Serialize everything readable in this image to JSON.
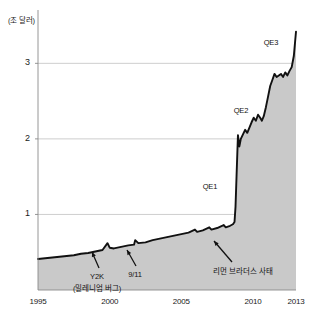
{
  "figure": {
    "background": "#ffffff",
    "width": 318,
    "height": 323
  },
  "chart_data": {
    "type": "area",
    "title": "",
    "subtitle": "",
    "xlabel": "",
    "ylabel": "(조 달러)",
    "ylabel_meaning": "trillion dollars",
    "xlim": [
      1995,
      2013
    ],
    "ylim": [
      0,
      3.6
    ],
    "yticks": [
      1,
      2,
      3
    ],
    "ytick_labels": [
      "1",
      "2",
      "3"
    ],
    "xticks": [
      1995,
      2000,
      2005,
      2010,
      2013
    ],
    "xtick_labels": [
      "1995",
      "2000",
      "2005",
      "2010",
      "2013"
    ],
    "grid": "horizontal",
    "legend": "none",
    "line_color": "#111111",
    "fill_color": "#c9c9c9",
    "grid_color": "#b9b9b9",
    "axis_color": "#8a8a8a",
    "series": [
      {
        "name": "Federal Reserve balance sheet",
        "x": [
          1995.0,
          1995.5,
          1996.0,
          1996.5,
          1997.0,
          1997.5,
          1998.0,
          1998.5,
          1999.0,
          1999.5,
          1999.85,
          2000.0,
          2000.3,
          2000.8,
          2001.3,
          2001.7,
          2001.78,
          2002.0,
          2002.5,
          2003.0,
          2003.5,
          2004.0,
          2004.5,
          2005.0,
          2005.5,
          2005.95,
          2006.1,
          2006.5,
          2006.95,
          2007.1,
          2007.5,
          2007.95,
          2008.1,
          2008.4,
          2008.6,
          2008.71,
          2008.78,
          2008.85,
          2008.95,
          2009.05,
          2009.15,
          2009.3,
          2009.45,
          2009.6,
          2009.75,
          2009.9,
          2010.05,
          2010.2,
          2010.35,
          2010.5,
          2010.62,
          2010.75,
          2010.9,
          2011.05,
          2011.2,
          2011.35,
          2011.5,
          2011.65,
          2011.8,
          2011.95,
          2012.1,
          2012.25,
          2012.4,
          2012.55,
          2012.7,
          2012.85,
          2013.0
        ],
        "values": [
          0.41,
          0.42,
          0.43,
          0.44,
          0.45,
          0.46,
          0.48,
          0.49,
          0.51,
          0.53,
          0.62,
          0.56,
          0.55,
          0.57,
          0.59,
          0.6,
          0.66,
          0.62,
          0.63,
          0.66,
          0.68,
          0.7,
          0.72,
          0.74,
          0.76,
          0.8,
          0.77,
          0.79,
          0.83,
          0.8,
          0.82,
          0.86,
          0.83,
          0.85,
          0.87,
          0.9,
          1.1,
          1.5,
          2.05,
          1.9,
          2.0,
          2.06,
          2.12,
          2.08,
          2.15,
          2.22,
          2.28,
          2.24,
          2.32,
          2.28,
          2.24,
          2.3,
          2.42,
          2.56,
          2.7,
          2.78,
          2.86,
          2.82,
          2.84,
          2.86,
          2.82,
          2.88,
          2.84,
          2.9,
          2.95,
          3.1,
          3.42
        ]
      }
    ],
    "annotations": [
      {
        "id": "qe1",
        "label": "QE1",
        "x_px": 210,
        "y_px": 182,
        "arrow": false
      },
      {
        "id": "qe2",
        "label": "QE2",
        "x_px": 241,
        "y_px": 106,
        "arrow": false
      },
      {
        "id": "qe3",
        "label": "QE3",
        "x_px": 271,
        "y_px": 38,
        "arrow": false
      },
      {
        "id": "y2k",
        "label": "Y2K",
        "sublabel": "(밀레니엄 버그)",
        "x_px": 97,
        "y_px": 272,
        "arrow": true
      },
      {
        "id": "sep11",
        "label": "9/11",
        "x_px": 135,
        "y_px": 270,
        "arrow": true
      },
      {
        "id": "lehman",
        "label": "리먼 브라더스 사태",
        "x_px": 243,
        "y_px": 265,
        "arrow": true
      }
    ]
  }
}
